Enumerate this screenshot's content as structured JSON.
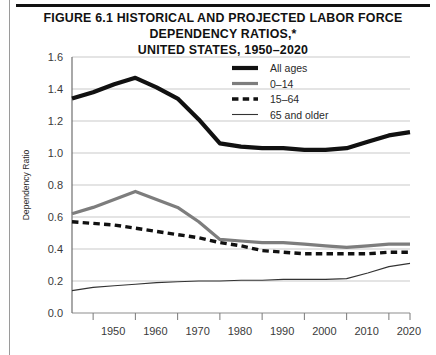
{
  "figure": {
    "title_line1": "FIGURE 6.1  HISTORICAL AND PROJECTED LABOR FORCE DEPENDENCY RATIOS,*",
    "title_line2": "UNITED STATES, 1950–2020",
    "footnote": ""
  },
  "chart_data": {
    "type": "line",
    "title": "Figure 6.1 Historical and Projected Labor Force Dependency Ratios,* United States, 1950–2020",
    "xlabel": "",
    "ylabel": "Dependency Ratio",
    "xlim": [
      1945,
      2025
    ],
    "ylim": [
      0.0,
      1.6
    ],
    "grid": true,
    "legend_position": "top-right",
    "xticks": [
      1950,
      1960,
      1970,
      1980,
      1990,
      2000,
      2010,
      2020
    ],
    "xtick_labels": [
      "1950",
      "1960",
      "1970",
      "1980",
      "1990",
      "2000",
      "2010",
      "2020"
    ],
    "yticks": [
      0.0,
      0.2,
      0.4,
      0.6,
      0.8,
      1.0,
      1.2,
      1.4,
      1.6
    ],
    "ytick_labels": [
      "0.0",
      "0.2",
      "0.4",
      "0.6",
      "0.8",
      "1.0",
      "1.2",
      "1.4",
      "1.6"
    ],
    "x": [
      1945,
      1950,
      1955,
      1960,
      1965,
      1970,
      1975,
      1980,
      1985,
      1990,
      1995,
      2000,
      2005,
      2010,
      2015,
      2020,
      2025
    ],
    "series": [
      {
        "name": "All ages",
        "style": "solid-thick",
        "color": "#111111",
        "width": 4.2,
        "values": [
          1.34,
          1.38,
          1.43,
          1.47,
          1.41,
          1.34,
          1.21,
          1.06,
          1.04,
          1.03,
          1.03,
          1.02,
          1.02,
          1.03,
          1.07,
          1.11,
          1.13
        ]
      },
      {
        "name": "0–14",
        "style": "solid-medium",
        "color": "#7d7d7d",
        "width": 3.2,
        "values": [
          0.62,
          0.66,
          0.71,
          0.76,
          0.71,
          0.66,
          0.57,
          0.46,
          0.45,
          0.44,
          0.44,
          0.43,
          0.42,
          0.41,
          0.42,
          0.43,
          0.43
        ]
      },
      {
        "name": "15–64",
        "style": "dashed",
        "color": "#111111",
        "width": 3.4,
        "values": [
          0.57,
          0.56,
          0.55,
          0.53,
          0.51,
          0.49,
          0.47,
          0.44,
          0.42,
          0.39,
          0.38,
          0.37,
          0.37,
          0.37,
          0.37,
          0.38,
          0.38
        ]
      },
      {
        "name": "65 and older",
        "style": "solid-thin",
        "color": "#333333",
        "width": 1.1,
        "values": [
          0.14,
          0.16,
          0.17,
          0.18,
          0.19,
          0.195,
          0.2,
          0.2,
          0.205,
          0.205,
          0.21,
          0.21,
          0.21,
          0.215,
          0.25,
          0.29,
          0.31
        ]
      }
    ],
    "legend": [
      {
        "label": "All ages",
        "style": "solid-thick",
        "color": "#111111"
      },
      {
        "label": "0–14",
        "style": "solid-medium",
        "color": "#7d7d7d"
      },
      {
        "label": "15–64",
        "style": "dashed",
        "color": "#111111"
      },
      {
        "label": "65 and older",
        "style": "solid-thin",
        "color": "#333333"
      }
    ]
  }
}
